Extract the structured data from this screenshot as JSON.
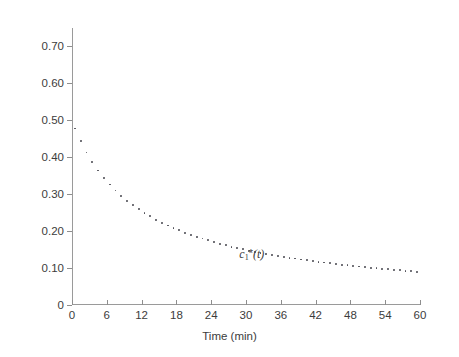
{
  "chart_data": {
    "type": "scatter",
    "title": "",
    "subtitle": "",
    "xlabel": "Time (min)",
    "ylabel": "Concentration (mg/ml)",
    "xlim": [
      0,
      60
    ],
    "ylim": [
      0,
      0.75
    ],
    "grid": false,
    "legend_position": "none",
    "xticks": [
      0,
      6,
      12,
      18,
      24,
      30,
      36,
      42,
      48,
      54,
      60
    ],
    "xticklabels": [
      "0",
      "6",
      "12",
      "18",
      "24",
      "30",
      "36",
      "42",
      "48",
      "54",
      "60"
    ],
    "yticks": [
      0,
      0.1,
      0.2,
      0.3,
      0.4,
      0.5,
      0.6,
      0.7
    ],
    "yticklabels": [
      "0",
      "0.10",
      "0.20",
      "0.30",
      "0.40",
      "0.50",
      "0.60",
      "0.70"
    ],
    "annotations": [
      {
        "text": "c1*(t)",
        "x": 31.0,
        "y": 0.139,
        "style": "italic"
      }
    ],
    "series": [
      {
        "name": "c1*(t)",
        "marker": "dot",
        "color": "#4a4a52",
        "x": [
          0.5,
          1.5,
          2.5,
          3.5,
          4.5,
          5.5,
          6.5,
          7.5,
          8.5,
          9.5,
          10.5,
          11.5,
          12.5,
          13.5,
          14.5,
          15.5,
          16.5,
          17.5,
          18.5,
          19.5,
          20.5,
          21.5,
          22.5,
          23.5,
          24.5,
          25.5,
          26.5,
          27.5,
          28.5,
          29.5,
          30.5,
          31.5,
          32.5,
          33.5,
          34.5,
          35.5,
          36.5,
          37.5,
          38.5,
          39.5,
          40.5,
          41.5,
          42.5,
          43.5,
          44.5,
          45.5,
          46.5,
          47.5,
          48.5,
          49.5,
          50.5,
          51.5,
          52.5,
          53.5,
          54.5,
          55.5,
          56.5,
          57.5,
          58.5,
          59.5
        ],
        "y": [
          0.478,
          0.443,
          0.413,
          0.387,
          0.364,
          0.344,
          0.326,
          0.31,
          0.295,
          0.282,
          0.27,
          0.259,
          0.249,
          0.24,
          0.231,
          0.223,
          0.215,
          0.208,
          0.202,
          0.196,
          0.19,
          0.185,
          0.18,
          0.175,
          0.17,
          0.166,
          0.162,
          0.158,
          0.154,
          0.151,
          0.147,
          0.144,
          0.141,
          0.138,
          0.136,
          0.133,
          0.13,
          0.128,
          0.126,
          0.123,
          0.121,
          0.119,
          0.117,
          0.115,
          0.113,
          0.111,
          0.109,
          0.108,
          0.106,
          0.104,
          0.103,
          0.101,
          0.1,
          0.098,
          0.097,
          0.095,
          0.094,
          0.093,
          0.091,
          0.09
        ]
      }
    ]
  },
  "axes": {
    "y_title": "Concentration (mg/ml)",
    "x_title": "Time (min)"
  },
  "label": {
    "variable": "c",
    "subscript": "1",
    "star": "*",
    "argument": "(t)"
  }
}
